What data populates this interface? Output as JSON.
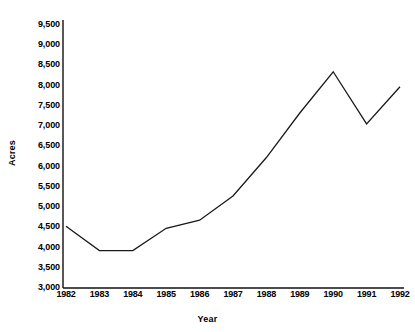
{
  "chart_data": {
    "type": "line",
    "title": "",
    "xlabel": "Year",
    "ylabel": "Acres",
    "categories": [
      "1982",
      "1983",
      "1984",
      "1985",
      "1986",
      "1987",
      "1988",
      "1989",
      "1990",
      "1991",
      "1992"
    ],
    "x": [
      1982,
      1983,
      1984,
      1985,
      1986,
      1987,
      1988,
      1989,
      1990,
      1991,
      1992
    ],
    "values": [
      4500,
      3900,
      3900,
      4450,
      4650,
      5250,
      6200,
      7300,
      8320,
      7030,
      7950
    ],
    "series": [
      {
        "name": "Acres",
        "values": [
          4500,
          3900,
          3900,
          4450,
          4650,
          5250,
          6200,
          7300,
          8320,
          7030,
          7950
        ]
      }
    ],
    "ylim": [
      3000,
      9500
    ],
    "ytick_step": 500,
    "ytick_labels": [
      "9,500",
      "9,000",
      "8,500",
      "8,000",
      "7,500",
      "7,000",
      "6,500",
      "6,000",
      "5,500",
      "5,000",
      "4,500",
      "4,000",
      "3,500",
      "3,000"
    ],
    "ytick_values": [
      9500,
      9000,
      8500,
      8000,
      7500,
      7000,
      6500,
      6000,
      5500,
      5000,
      4500,
      4000,
      3500,
      3000
    ],
    "xtick_labels": [
      "1982",
      "1983",
      "1984",
      "1985",
      "1986",
      "1987",
      "1988",
      "1989",
      "1990",
      "1991",
      "1992"
    ],
    "grid": false,
    "legend": null,
    "legend_position": "none",
    "line_color": "#1a1a1a",
    "background_color": "#ffffff",
    "markers": false,
    "axes_spines": [
      "left",
      "bottom"
    ]
  }
}
